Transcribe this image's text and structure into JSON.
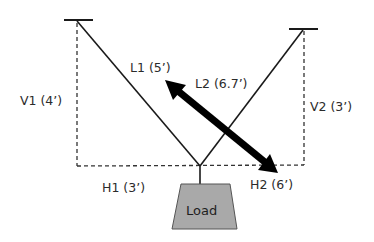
{
  "diagram": {
    "labels": {
      "l1": "L1 (5’)",
      "l2": "L2 (6.7’)",
      "v1": "V1 (4’)",
      "v2": "V2 (3’)",
      "h1": "H1 (3’)",
      "h2": "H2 (6’)",
      "load": "Load"
    },
    "colors": {
      "line": "#1a1a1a",
      "arrow": "#000000",
      "load_fill": "#a9a9a9",
      "load_stroke": "#555555",
      "text": "#2b2b2b"
    }
  }
}
